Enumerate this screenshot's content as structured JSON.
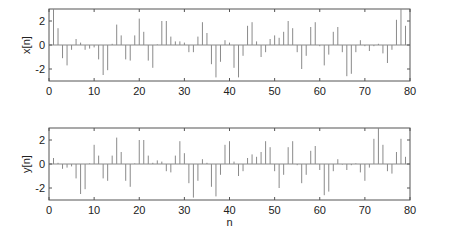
{
  "chart_data": [
    {
      "type": "stem",
      "title": "",
      "xlabel": "",
      "ylabel": "x[n]",
      "xlim": [
        0,
        80
      ],
      "ylim": [
        -3,
        3
      ],
      "xticks": [
        0,
        10,
        20,
        30,
        40,
        50,
        60,
        70,
        80
      ],
      "yticks": [
        -2,
        0,
        2
      ],
      "grid": false,
      "color": "#8a8a8a",
      "x": [
        1,
        2,
        3,
        4,
        5,
        6,
        7,
        8,
        9,
        10,
        11,
        12,
        13,
        14,
        15,
        16,
        17,
        18,
        19,
        20,
        21,
        22,
        23,
        24,
        25,
        26,
        27,
        28,
        29,
        30,
        31,
        32,
        33,
        34,
        35,
        36,
        37,
        38,
        39,
        40,
        41,
        42,
        43,
        44,
        45,
        46,
        47,
        48,
        49,
        50,
        51,
        52,
        53,
        54,
        55,
        56,
        57,
        58,
        59,
        60,
        61,
        62,
        63,
        64,
        65,
        66,
        67,
        68,
        69,
        70,
        71,
        72,
        73,
        74,
        75,
        76,
        77,
        78,
        79
      ],
      "values": [
        3.0,
        1.4,
        -1.1,
        -1.7,
        -0.4,
        0.5,
        0.2,
        -0.4,
        -0.3,
        -0.2,
        -1.2,
        -2.5,
        -2.1,
        0.1,
        1.7,
        0.8,
        -1.2,
        -1.3,
        0.8,
        2.2,
        1.1,
        -1.3,
        -1.9,
        0.05,
        2.0,
        2.0,
        0.7,
        0.3,
        0.3,
        0.2,
        -0.6,
        -0.6,
        0.7,
        1.9,
        1.0,
        -1.6,
        -2.7,
        -1.4,
        0.4,
        0.2,
        -1.9,
        -2.7,
        -0.9,
        1.6,
        1.9,
        0.3,
        -1.0,
        -0.6,
        0.5,
        0.8,
        0.6,
        1.1,
        2.0,
        1.4,
        -0.6,
        -2.0,
        -0.9,
        1.5,
        1.9,
        -0.1,
        -1.7,
        -0.8,
        1.1,
        1.5,
        -0.6,
        -2.6,
        -2.4,
        -0.6,
        0.4,
        -0.1,
        -0.5,
        -0.1,
        0.1,
        -0.7,
        -1.5,
        -0.4,
        2.1,
        3.0,
        1.6
      ]
    },
    {
      "type": "stem",
      "title": "",
      "xlabel": "n",
      "ylabel": "y[n]",
      "xlim": [
        0,
        80
      ],
      "ylim": [
        -3,
        3
      ],
      "xticks": [
        0,
        10,
        20,
        30,
        40,
        50,
        60,
        70,
        80
      ],
      "yticks": [
        -2,
        0,
        2
      ],
      "grid": false,
      "color": "#8a8a8a",
      "x": [
        1,
        2,
        3,
        4,
        5,
        6,
        7,
        8,
        9,
        10,
        11,
        12,
        13,
        14,
        15,
        16,
        17,
        18,
        19,
        20,
        21,
        22,
        23,
        24,
        25,
        26,
        27,
        28,
        29,
        30,
        31,
        32,
        33,
        34,
        35,
        36,
        37,
        38,
        39,
        40,
        41,
        42,
        43,
        44,
        45,
        46,
        47,
        48,
        49,
        50,
        51,
        52,
        53,
        54,
        55,
        56,
        57,
        58,
        59,
        60,
        61,
        62,
        63,
        64,
        65,
        66,
        67,
        68,
        69,
        70,
        71,
        72,
        73,
        74,
        75,
        76,
        77,
        78,
        79
      ],
      "values": [
        0.5,
        0.1,
        -0.4,
        -0.3,
        -0.2,
        -1.2,
        -2.5,
        -2.1,
        0.05,
        1.6,
        0.7,
        -1.2,
        -1.4,
        0.7,
        2.2,
        1.0,
        -1.4,
        -1.9,
        0.05,
        2.0,
        2.0,
        0.7,
        0.1,
        0.3,
        0.2,
        -0.6,
        -0.7,
        0.7,
        1.9,
        0.9,
        -1.6,
        -2.8,
        -1.4,
        0.4,
        0.1,
        -1.9,
        -2.7,
        -0.9,
        1.6,
        1.9,
        0.2,
        -1.0,
        -0.6,
        0.5,
        0.8,
        0.6,
        1.0,
        1.9,
        1.4,
        -0.6,
        -2.0,
        -0.9,
        1.4,
        1.9,
        -0.1,
        -1.6,
        -0.9,
        1.1,
        1.5,
        -0.5,
        -2.6,
        -2.3,
        -0.6,
        0.4,
        -0.05,
        -0.5,
        -0.1,
        0.05,
        -0.7,
        -1.4,
        -0.3,
        2.1,
        3.0,
        1.6,
        -0.6,
        -0.8,
        1.0,
        2.1,
        0.6
      ]
    }
  ]
}
